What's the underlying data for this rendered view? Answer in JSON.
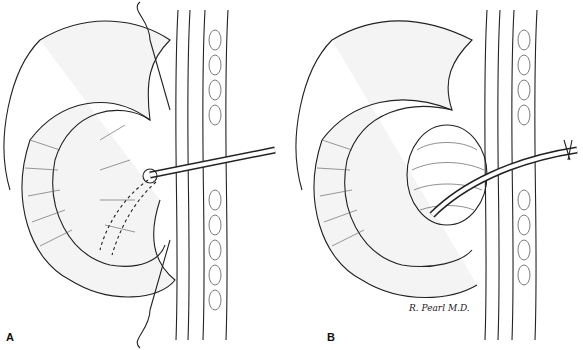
{
  "figure": {
    "panels": [
      {
        "label": "A",
        "description": "Line illustration: retracted organ with tube inserted through abdominal wall, dashed internal path"
      },
      {
        "label": "B",
        "description": "Line illustration: organ drawn up against abdominal wall with tube passing through, purse-string"
      }
    ],
    "signature": "R. Pearl M.D."
  }
}
